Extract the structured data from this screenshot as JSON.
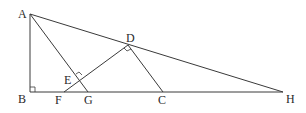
{
  "diagram": {
    "points": {
      "A": {
        "label": "A",
        "x": 30,
        "y": 14
      },
      "B": {
        "label": "B",
        "x": 30,
        "y": 92
      },
      "H": {
        "label": "H",
        "x": 283,
        "y": 92
      },
      "D": {
        "label": "D",
        "x": 128,
        "y": 45
      },
      "C": {
        "label": "C",
        "x": 163,
        "y": 92
      },
      "G": {
        "label": "G",
        "x": 88,
        "y": 92
      },
      "F": {
        "label": "F",
        "x": 64,
        "y": 92
      },
      "E": {
        "label": "E",
        "x": 79,
        "y": 77
      }
    },
    "segments": [
      "AB",
      "BH",
      "AH",
      "AG",
      "DF",
      "DC"
    ],
    "right_angles": [
      "B",
      "D",
      "E"
    ],
    "labels": {
      "A": "A",
      "B": "B",
      "C": "C",
      "D": "D",
      "E": "E",
      "F": "F",
      "G": "G",
      "H": "H"
    }
  }
}
